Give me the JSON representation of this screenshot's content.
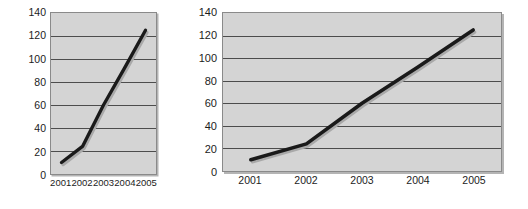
{
  "chart_data": [
    {
      "id": "narrow",
      "type": "line",
      "title": "",
      "subtitle": "",
      "xlabel": "",
      "ylabel": "",
      "categories": [
        "2001",
        "2002",
        "2003",
        "2004",
        "2005"
      ],
      "x": [
        2001,
        2002,
        2003,
        2004,
        2005
      ],
      "values": [
        10,
        24,
        60,
        92,
        125
      ],
      "series": [
        {
          "name": "",
          "values": [
            10,
            24,
            60,
            92,
            125
          ]
        }
      ],
      "ylim": [
        0,
        140
      ],
      "yticks": [
        0,
        20,
        40,
        60,
        80,
        100,
        120,
        140
      ],
      "ytick_labels": [
        "0",
        "20",
        "40",
        "60",
        "80",
        "100",
        "120",
        "140"
      ],
      "xtick_labels": [
        "2001",
        "2002",
        "2003",
        "2004",
        "2005"
      ],
      "grid": "horizontal",
      "legend": "none",
      "plot_background": "#d4d4d4",
      "line_color": "#1a1a1a",
      "line_width": 3.4,
      "shadow_color": "#a9a9a9",
      "frame_color": "#8a8a8a",
      "gridline_color": "#4a4a4a"
    },
    {
      "id": "wide",
      "type": "line",
      "title": "",
      "subtitle": "",
      "xlabel": "",
      "ylabel": "",
      "categories": [
        "2001",
        "2002",
        "2003",
        "2004",
        "2005"
      ],
      "x": [
        2001,
        2002,
        2003,
        2004,
        2005
      ],
      "values": [
        10,
        24,
        60,
        92,
        125
      ],
      "series": [
        {
          "name": "",
          "values": [
            10,
            24,
            60,
            92,
            125
          ]
        }
      ],
      "ylim": [
        0,
        140
      ],
      "yticks": [
        0,
        20,
        40,
        60,
        80,
        100,
        120,
        140
      ],
      "ytick_labels": [
        "0",
        "20",
        "40",
        "60",
        "80",
        "100",
        "120",
        "140"
      ],
      "xtick_labels": [
        "2001",
        "2002",
        "2003",
        "2004",
        "2005"
      ],
      "grid": "horizontal",
      "legend": "none",
      "plot_background": "#d4d4d4",
      "line_color": "#1a1a1a",
      "line_width": 3.6,
      "shadow_color": "#a9a9a9",
      "frame_color": "#8a8a8a",
      "gridline_color": "#4a4a4a"
    }
  ]
}
